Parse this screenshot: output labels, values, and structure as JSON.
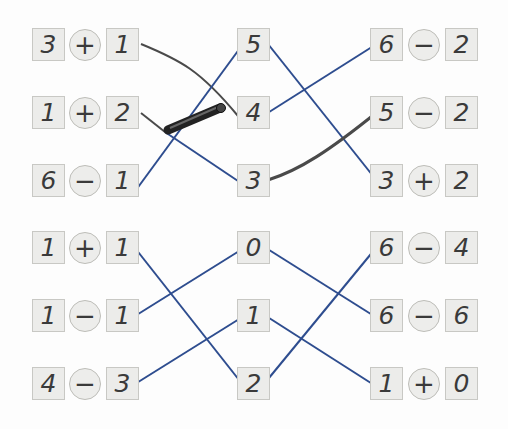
{
  "colors": {
    "blue_line": "#2e4d8f",
    "pencil_line": "#4a4a4a",
    "box_fill": "#ececea"
  },
  "left": [
    {
      "a": "3",
      "op": "+",
      "b": "1"
    },
    {
      "a": "1",
      "op": "+",
      "b": "2"
    },
    {
      "a": "6",
      "op": "−",
      "b": "1"
    },
    {
      "a": "1",
      "op": "+",
      "b": "1"
    },
    {
      "a": "1",
      "op": "−",
      "b": "1"
    },
    {
      "a": "4",
      "op": "−",
      "b": "3"
    }
  ],
  "middle": [
    "5",
    "4",
    "3",
    "0",
    "1",
    "2"
  ],
  "right": [
    {
      "a": "6",
      "op": "−",
      "b": "2"
    },
    {
      "a": "5",
      "op": "−",
      "b": "2"
    },
    {
      "a": "3",
      "op": "+",
      "b": "2"
    },
    {
      "a": "6",
      "op": "−",
      "b": "4"
    },
    {
      "a": "6",
      "op": "−",
      "b": "6"
    },
    {
      "a": "1",
      "op": "+",
      "b": "0"
    }
  ],
  "connections": [
    {
      "from": "left 3+1",
      "to": "middle 4",
      "style": "pencil"
    },
    {
      "from": "left 1+2",
      "to": "middle 3",
      "style": "pencil+blue"
    },
    {
      "from": "left 6−1",
      "to": "middle 5",
      "style": "blue"
    },
    {
      "from": "middle 5",
      "to": "right 3+2",
      "style": "blue"
    },
    {
      "from": "middle 4",
      "to": "right 6−2",
      "style": "blue"
    },
    {
      "from": "middle 3",
      "to": "right 5−2",
      "style": "pencil"
    },
    {
      "from": "left 1+1",
      "to": "middle 2",
      "style": "blue"
    },
    {
      "from": "left 1−1",
      "to": "middle 0",
      "style": "blue"
    },
    {
      "from": "left 4−3",
      "to": "middle 1",
      "style": "blue"
    },
    {
      "from": "middle 0",
      "to": "right 6−6",
      "style": "blue"
    },
    {
      "from": "middle 1",
      "to": "right 1+0",
      "style": "blue"
    },
    {
      "from": "middle 2",
      "to": "right 6−4",
      "style": "blue"
    }
  ]
}
